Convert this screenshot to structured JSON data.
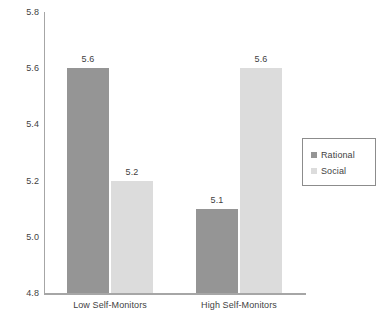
{
  "chart_data": {
    "type": "bar",
    "title": "",
    "xlabel": "",
    "ylabel": "",
    "categories": [
      "Low Self-Monitors",
      "High Self-Monitors"
    ],
    "series": [
      {
        "name": "Rational",
        "color": "#959595",
        "values": [
          5.6,
          5.1
        ],
        "labels": [
          "5.6",
          "5.1"
        ]
      },
      {
        "name": "Social",
        "color": "#dcdcdc",
        "values": [
          5.2,
          5.6
        ],
        "labels": [
          "5.2",
          "5.6"
        ]
      }
    ],
    "ylim": [
      4.8,
      5.8
    ],
    "ytick_values": [
      5.8,
      5.6,
      5.4,
      5.2,
      5.0,
      4.8
    ],
    "ytick_labels": [
      "5.8",
      "5.6",
      "5.4",
      "5.2",
      "5.0",
      "4.8"
    ],
    "grid": false,
    "legend_position": "right",
    "axis_color": "#a6a6a6",
    "text_color": "#3f3f3f",
    "background": "#ffffff"
  },
  "legend": {
    "items": [
      {
        "label": "Rational",
        "color": "#959595"
      },
      {
        "label": "Social",
        "color": "#dcdcdc"
      }
    ]
  }
}
